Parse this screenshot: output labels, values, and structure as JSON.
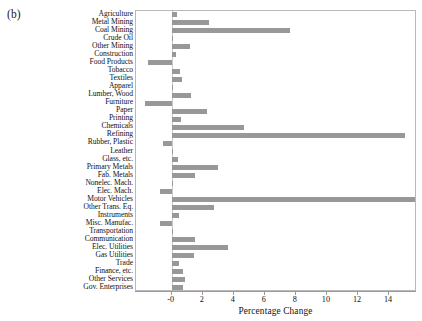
{
  "figure": {
    "panel_label": "(b)",
    "bar_color": "#989898",
    "axis_color": "#9a9a9a",
    "frame_color": "#b9b9b9"
  },
  "chart_data": {
    "type": "bar",
    "orientation": "horizontal",
    "title": "",
    "panel": "(b)",
    "xlabel": "Percentage Change",
    "ylabel": "",
    "xlim": [
      -2.3,
      15.8
    ],
    "xticks": [
      0,
      2,
      4,
      6,
      8,
      10,
      12,
      14
    ],
    "xticklabels": [
      "-0",
      "2",
      "4",
      "6",
      "8",
      "10",
      "12",
      "14"
    ],
    "grid": false,
    "legend": false,
    "categories": [
      "Agriculture",
      "Metal Mining",
      "Coal Mining",
      "Crude Oil",
      "Other Mining",
      "Construction",
      "Food Products",
      "Tobacco",
      "Textiles",
      "Apparel",
      "Lumber, Wood",
      "Furniture",
      "Paper",
      "Printing",
      "Chemicals",
      "Refining",
      "Rubber, Plastic",
      "Leather",
      "Glass, etc.",
      "Primary Metals",
      "Fab. Metals",
      "Nonelec. Mach.",
      "Elec. Mach.",
      "Motor Vehicles",
      "Other Trans. Eq.",
      "Instruments",
      "Misc. Manufac.",
      "Transportation",
      "Communication",
      "Elec. Utilities",
      "Gas Utilities",
      "Trade",
      "Finance, etc.",
      "Other Services",
      "Gov. Enterprises"
    ],
    "values": [
      0.35,
      2.4,
      7.65,
      0.1,
      1.15,
      0.25,
      -1.5,
      0.55,
      0.65,
      0.02,
      1.25,
      -1.75,
      2.25,
      0.6,
      4.65,
      15.0,
      -0.55,
      0.05,
      0.4,
      3.0,
      1.5,
      0.1,
      -0.75,
      15.7,
      2.7,
      0.45,
      -0.75,
      0.1,
      1.5,
      3.65,
      1.45,
      0.5,
      0.75,
      0.85,
      0.75
    ]
  }
}
